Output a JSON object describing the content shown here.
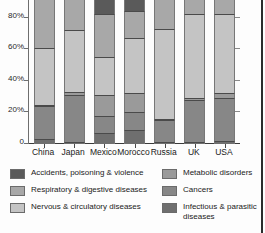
{
  "chart_data": {
    "type": "bar",
    "stacked": true,
    "stack_mode": "percent",
    "title": "",
    "subtitle": "",
    "xlabel": "",
    "ylabel": "",
    "ylim": [
      0,
      100
    ],
    "grid": false,
    "legend_position": "bottom",
    "categories": [
      "China",
      "Japan",
      "Mexico",
      "Morocco",
      "Russia",
      "UK",
      "USA"
    ],
    "y_ticks": [
      {
        "value": 80,
        "label": "80%"
      },
      {
        "value": 60,
        "label": "60%"
      },
      {
        "value": 40,
        "label": "40%"
      },
      {
        "value": 20,
        "label": "20%"
      },
      {
        "value": 0,
        "label": "0"
      }
    ],
    "series": [
      {
        "name": "Infectious & parasitic diseases",
        "color": "#6f6f6f",
        "values": [
          3,
          1,
          7,
          9,
          1,
          1,
          2
        ]
      },
      {
        "name": "Cancers",
        "color": "#878787",
        "values": [
          21,
          30,
          11,
          11,
          14,
          27,
          27
        ]
      },
      {
        "name": "Metabolic disorders",
        "color": "#9a9a9a",
        "values": [
          1,
          2,
          13,
          12,
          1,
          1,
          3
        ]
      },
      {
        "name": "Nervous & circulatory diseases",
        "color": "#c4c4c4",
        "values": [
          36,
          39,
          24,
          35,
          57,
          53,
          50
        ]
      },
      {
        "name": "Respiratory & digestive diseases",
        "color": "#a8a8a8",
        "values": [
          31,
          21,
          27,
          17,
          19,
          16,
          13
        ]
      },
      {
        "name": "Accidents, poisoning & violence",
        "color": "#5a5a5a",
        "values": [
          8,
          7,
          18,
          16,
          8,
          2,
          5
        ]
      }
    ],
    "legend": [
      {
        "label": "Accidents, poisoning & violence",
        "color": "#5a5a5a",
        "column": "left",
        "icon": "legend-swatch"
      },
      {
        "label": "Respiratory & digestive diseases",
        "color": "#a8a8a8",
        "column": "left",
        "icon": "legend-swatch"
      },
      {
        "label": "Nervous & circulatory diseases",
        "color": "#c4c4c4",
        "column": "left",
        "icon": "legend-swatch"
      },
      {
        "label": "Metabolic disorders",
        "color": "#9a9a9a",
        "column": "right",
        "icon": "legend-swatch"
      },
      {
        "label": "Cancers",
        "color": "#878787",
        "column": "right",
        "icon": "legend-swatch"
      },
      {
        "label": "Infectious & parasitic diseases",
        "color": "#6f6f6f",
        "column": "right",
        "icon": "legend-swatch"
      }
    ]
  },
  "colors": {
    "page_background": "#fdfdfd",
    "axis": "#4a4a4a",
    "text": "#1a1a1a",
    "frame_rule": "#2b2b2b"
  }
}
